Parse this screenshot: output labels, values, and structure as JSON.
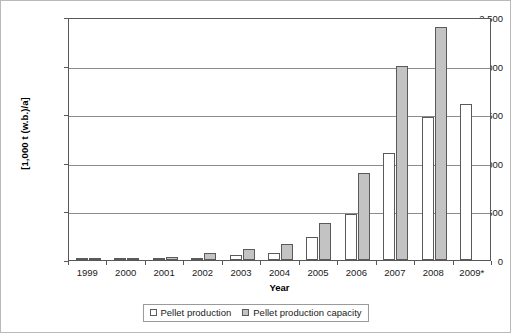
{
  "chart_data": {
    "type": "bar",
    "title": "",
    "xlabel": "Year",
    "ylabel": "[1,000 t (w.b.)/a]",
    "categories": [
      "1999",
      "2000",
      "2001",
      "2002",
      "2003",
      "2004",
      "2005",
      "2006",
      "2007",
      "2008",
      "2009*"
    ],
    "series": [
      {
        "name": "Pellet production",
        "color": "#ffffff",
        "values": [
          10,
          12,
          18,
          25,
          55,
          70,
          240,
          470,
          1100,
          1470,
          1600
        ]
      },
      {
        "name": "Pellet production capacity",
        "color": "#c3c3c3",
        "values": [
          12,
          15,
          30,
          75,
          110,
          165,
          380,
          900,
          2000,
          2400,
          null
        ]
      }
    ],
    "ylim": [
      0,
      2500
    ],
    "ytick_values": [
      0,
      500,
      1000,
      1500,
      2000,
      2500
    ],
    "ytick_labels": [
      "0",
      "500",
      "1,000",
      "1,500",
      "2,000",
      "2,500"
    ],
    "grid": true,
    "legend_position": "bottom-center",
    "legend_entries": [
      "Pellet production",
      "Pellet production capacity"
    ]
  },
  "colors": {
    "production_fill": "#ffffff",
    "capacity_fill": "#c3c3c3",
    "bar_border": "#5a5a5a",
    "gridline": "#8c8c8c",
    "axis": "#585858",
    "text": "#1a1a1a",
    "frame": "#b9b9b9"
  }
}
